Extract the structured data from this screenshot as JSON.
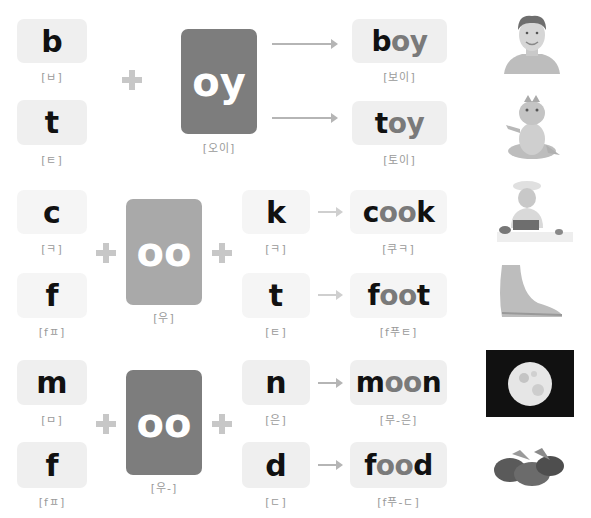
{
  "colors": {
    "card_dark": "#7d7d7d",
    "card_light": "#a9a9a9",
    "box_bg": "#efefef",
    "plus": "#c7c7c7",
    "arrow": "#b5b5b5",
    "pron_text": "#9a9a9a"
  },
  "section1": {
    "vowel": {
      "label": "oy",
      "pron": "[오이]"
    },
    "onsets": [
      {
        "letter": "b",
        "pron": "[ㅂ]"
      },
      {
        "letter": "t",
        "pron": "[ㅌ]"
      }
    ],
    "words": [
      {
        "word_start": "b",
        "word_vowel": "oy",
        "word_end": "",
        "pron": "[보이]",
        "image": "boy-photo"
      },
      {
        "word_start": "t",
        "word_vowel": "oy",
        "word_end": "",
        "pron": "[토이]",
        "image": "toy-dragon-photo"
      }
    ]
  },
  "section2": {
    "vowel": {
      "label": "oo",
      "pron": "[우]"
    },
    "onsets": [
      {
        "letter": "c",
        "pron": "[ㅋ]"
      },
      {
        "letter": "f",
        "pron": "[fㅍ]"
      }
    ],
    "codas": [
      {
        "letter": "k",
        "pron": "[ㅋ]"
      },
      {
        "letter": "t",
        "pron": "[ㅌ]"
      }
    ],
    "words": [
      {
        "word_start": "c",
        "word_vowel": "oo",
        "word_end": "k",
        "pron": "[쿠ㅋ]",
        "image": "cook-child-photo"
      },
      {
        "word_start": "f",
        "word_vowel": "oo",
        "word_end": "t",
        "pron": "[f푸ㅌ]",
        "image": "foot-photo"
      }
    ]
  },
  "section3": {
    "vowel": {
      "label": "oo",
      "pron": "[우-]"
    },
    "onsets": [
      {
        "letter": "m",
        "pron": "[ㅁ]"
      },
      {
        "letter": "f",
        "pron": "[fㅍ]"
      }
    ],
    "codas": [
      {
        "letter": "n",
        "pron": "[은]"
      },
      {
        "letter": "d",
        "pron": "[ㄷ]"
      }
    ],
    "words": [
      {
        "word_start": "m",
        "word_vowel": "oo",
        "word_end": "n",
        "pron": "[무-은]",
        "image": "moon-photo"
      },
      {
        "word_start": "f",
        "word_vowel": "oo",
        "word_end": "d",
        "pron": "[f푸-ㄷ]",
        "image": "food-photo"
      }
    ]
  }
}
